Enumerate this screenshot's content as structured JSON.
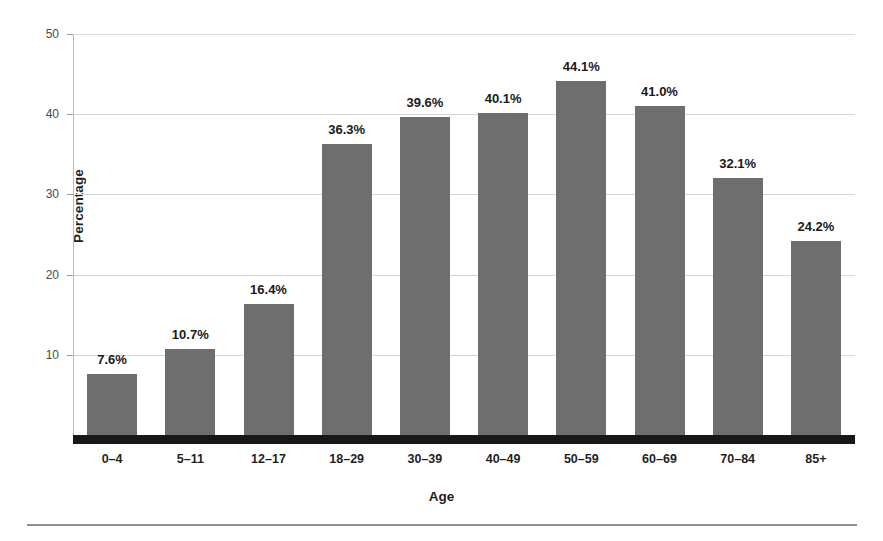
{
  "chart_data": {
    "type": "bar",
    "title": "",
    "xlabel": "Age",
    "ylabel": "Percentage",
    "categories": [
      "0–4",
      "5–11",
      "12–17",
      "18–29",
      "30–39",
      "40–49",
      "50–59",
      "60–69",
      "70–84",
      "85+"
    ],
    "values": [
      7.6,
      10.7,
      16.4,
      36.3,
      39.6,
      40.1,
      44.1,
      41.0,
      32.1,
      24.2
    ],
    "data_labels": [
      "7.6%",
      "10.7%",
      "16.4%",
      "36.3%",
      "39.6%",
      "40.1%",
      "44.1%",
      "41.0%",
      "32.1%",
      "24.2%"
    ],
    "ylim": [
      0,
      50
    ],
    "y_ticks": [
      10,
      20,
      30,
      40,
      50
    ],
    "y_tick_labels": [
      "10",
      "20",
      "30",
      "40",
      "50"
    ],
    "grid": "horizontal",
    "legend": "none",
    "bar_color": "#6e6e6e",
    "gridline_color": "#d4d4d4",
    "axis_color": "#17171a",
    "label_color": "#1a1a1a"
  }
}
